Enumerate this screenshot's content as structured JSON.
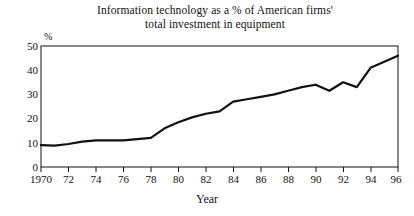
{
  "chart_data": {
    "type": "line",
    "title": "Information technology as a % of American firms' total investment in equipment",
    "title_lines": [
      "Information technology as a % of American firms'",
      "total investment in equipment"
    ],
    "xlabel": "Year",
    "ylabel": "%",
    "y_unit_label": "%",
    "xlim": [
      1970,
      1996
    ],
    "ylim": [
      0,
      50
    ],
    "grid": false,
    "legend": false,
    "y_ticks": [
      0,
      10,
      20,
      30,
      40,
      50
    ],
    "y_tick_labels": [
      "0",
      "10",
      "20",
      "30",
      "40",
      "50"
    ],
    "x_ticks": [
      1970,
      1972,
      1974,
      1976,
      1978,
      1980,
      1982,
      1984,
      1986,
      1988,
      1990,
      1992,
      1994,
      1996
    ],
    "x_tick_labels": [
      "1970",
      "72",
      "74",
      "76",
      "78",
      "80",
      "82",
      "84",
      "86",
      "88",
      "90",
      "92",
      "94",
      "96"
    ],
    "x": [
      1970,
      1971,
      1972,
      1973,
      1974,
      1975,
      1976,
      1977,
      1978,
      1979,
      1980,
      1981,
      1982,
      1983,
      1984,
      1985,
      1986,
      1987,
      1988,
      1989,
      1990,
      1991,
      1992,
      1993,
      1994,
      1995,
      1996
    ],
    "values": [
      9,
      8.8,
      9.5,
      10.5,
      11,
      11,
      11,
      11.5,
      12,
      16,
      18.5,
      20.5,
      22,
      23,
      27,
      28,
      29,
      30,
      31.5,
      33,
      34,
      31.5,
      35,
      33,
      41,
      43.5,
      46
    ],
    "series": [
      {
        "name": "Information technology share of equipment investment",
        "color": "#111111",
        "values": [
          9,
          8.8,
          9.5,
          10.5,
          11,
          11,
          11,
          11.5,
          12,
          16,
          18.5,
          20.5,
          22,
          23,
          27,
          28,
          29,
          30,
          31.5,
          33,
          34,
          31.5,
          35,
          33,
          41,
          43.5,
          46
        ]
      }
    ],
    "line_color": "#111111",
    "line_width": 2.2,
    "frame_color": "#111111",
    "background": "#ffffff"
  }
}
